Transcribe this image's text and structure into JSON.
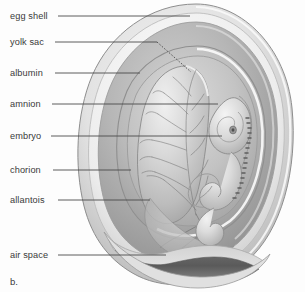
{
  "figure": {
    "panel_letter": "b.",
    "background_color": "#fdfdfd",
    "leader_line_color": "#4a4a4a",
    "text_color": "#3a3a3a"
  },
  "labels": [
    {
      "id": "egg-shell",
      "text": "egg shell",
      "text_x": 10,
      "text_y": 12,
      "line_y": 16,
      "line_x1": 58,
      "line_x2": 190,
      "target_x": 190,
      "target_y": 16
    },
    {
      "id": "yolk-sac",
      "text": "yolk sac",
      "text_x": 10,
      "text_y": 38,
      "line_y": 42,
      "line_x1": 55,
      "line_x2": 157,
      "target_x": 190,
      "target_y": 72
    },
    {
      "id": "albumin",
      "text": "albumin",
      "text_x": 10,
      "text_y": 69,
      "line_y": 73,
      "line_x1": 55,
      "line_x2": 140,
      "target_x": 140,
      "target_y": 73
    },
    {
      "id": "amnion",
      "text": "amnion",
      "text_x": 10,
      "text_y": 100,
      "line_y": 104,
      "line_x1": 52,
      "line_x2": 218,
      "target_x": 218,
      "target_y": 104
    },
    {
      "id": "embryo",
      "text": "embryo",
      "text_x": 10,
      "text_y": 132,
      "line_y": 136,
      "line_x1": 51,
      "line_x2": 222,
      "target_x": 222,
      "target_y": 136
    },
    {
      "id": "chorion",
      "text": "chorion",
      "text_x": 10,
      "text_y": 166,
      "line_y": 170,
      "line_x1": 53,
      "line_x2": 131,
      "target_x": 131,
      "target_y": 170
    },
    {
      "id": "allantois",
      "text": "allantois",
      "text_x": 10,
      "text_y": 196,
      "line_y": 200,
      "line_x1": 58,
      "line_x2": 150,
      "target_x": 150,
      "target_y": 200
    },
    {
      "id": "air-space",
      "text": "air space",
      "text_x": 10,
      "text_y": 251,
      "line_y": 255,
      "line_x1": 58,
      "line_x2": 166,
      "target_x": 166,
      "target_y": 255
    }
  ],
  "structures": {
    "egg_shell": "outermost hard shell of the egg",
    "shell_membrane": "thin pale membrane under the shell",
    "albumin": "egg white surrounding the embryo",
    "chorion": "outer extraembryonic membrane",
    "amnion": "fluid filled sac immediately around embryo",
    "allantois": "vascularised sac for waste and gas exchange",
    "yolk_sac": "large vascularised yolk sac left of the embryo",
    "embryo": "coiled chick embryo with head, eye and somites",
    "air_space": "dark crescent air cell at the blunt bottom end"
  }
}
